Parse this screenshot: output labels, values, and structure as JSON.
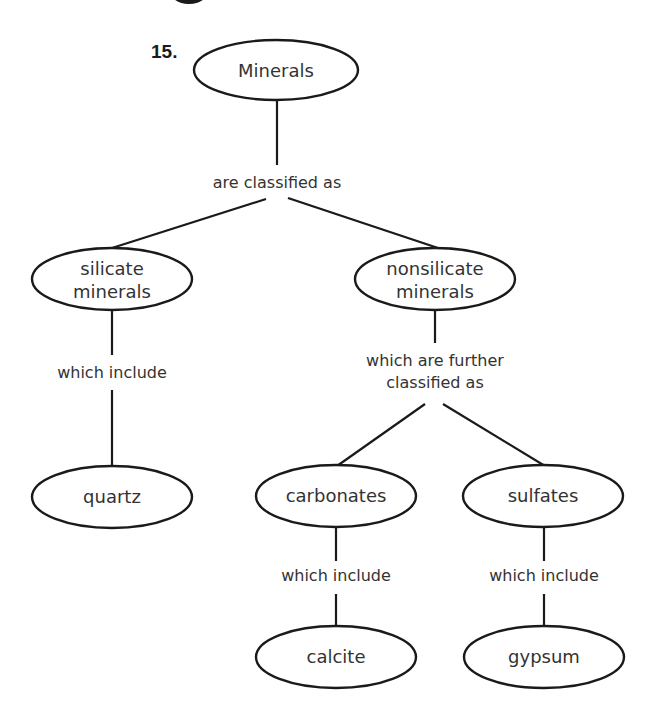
{
  "question_number": "15.",
  "colors": {
    "stroke": "#1a1a1a",
    "text": "#333333",
    "background": "#ffffff"
  },
  "nodes": {
    "root": {
      "label": "Minerals"
    },
    "silicate": {
      "lines": [
        "silicate",
        "minerals"
      ]
    },
    "nonsilicate": {
      "lines": [
        "nonsilicate",
        "minerals"
      ]
    },
    "quartz": {
      "label": "quartz"
    },
    "carbonates": {
      "label": "carbonates"
    },
    "sulfates": {
      "label": "sulfates"
    },
    "calcite": {
      "label": "calcite"
    },
    "gypsum": {
      "label": "gypsum"
    }
  },
  "links": {
    "root_to_classes": "are classified as",
    "silicate_to_quartz": "which include",
    "nonsilicate_to_subclasses": {
      "lines": [
        "which are further",
        "classified as"
      ]
    },
    "carbonates_to_calcite": "which include",
    "sulfates_to_gypsum": "which include"
  }
}
